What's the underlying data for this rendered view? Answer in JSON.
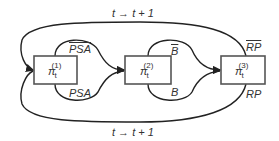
{
  "diagram": {
    "nodes": [
      {
        "id": "n1",
        "base": "π",
        "sub": "t",
        "sup": "(1)"
      },
      {
        "id": "n2",
        "base": "π",
        "sub": "t",
        "sup": "(2)"
      },
      {
        "id": "n3",
        "base": "π",
        "sub": "t",
        "sup": "(3)"
      }
    ],
    "edge_labels": {
      "top_loop": "t → t + 1",
      "bottom_loop": "t → t + 1",
      "psa_bar": "PSA",
      "psa": "PSA",
      "b_bar": "B",
      "b": "B",
      "rp_bar": "RP",
      "rp": "RP"
    }
  }
}
